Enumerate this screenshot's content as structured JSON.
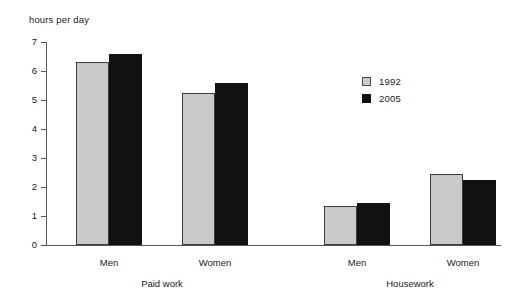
{
  "chart_data": {
    "type": "bar",
    "title": "",
    "subtitle": "",
    "ylabel": "hours per day",
    "xlabel": "",
    "ylim": [
      0,
      7
    ],
    "yticks": [
      "0",
      "1",
      "2",
      "3",
      "4",
      "5",
      "6",
      "7"
    ],
    "grid": false,
    "legend_position": "center-right",
    "categories": [
      "Men",
      "Women",
      "Men",
      "Women"
    ],
    "groups": [
      {
        "label": "Paid work",
        "categories": [
          "Men",
          "Women"
        ]
      },
      {
        "label": "Housework",
        "categories": [
          "Men",
          "Women"
        ]
      }
    ],
    "series": [
      {
        "name": "1992",
        "color": "#c9c9c9",
        "values": [
          6.3,
          5.25,
          1.35,
          2.45
        ]
      },
      {
        "name": "2005",
        "color": "#111111",
        "values": [
          6.6,
          5.6,
          1.45,
          2.25
        ]
      }
    ],
    "legend": [
      {
        "label": "1992",
        "color": "#c9c9c9"
      },
      {
        "label": "2005",
        "color": "#111111"
      }
    ]
  },
  "axis": {
    "y_title": "hours per day",
    "ticks": [
      {
        "value": 7,
        "label": "7"
      },
      {
        "value": 6,
        "label": "6"
      },
      {
        "value": 5,
        "label": "5"
      },
      {
        "value": 4,
        "label": "4"
      },
      {
        "value": 3,
        "label": "3"
      },
      {
        "value": 2,
        "label": "2"
      },
      {
        "value": 1,
        "label": "1"
      },
      {
        "value": 0,
        "label": "0"
      }
    ]
  },
  "bars": [
    {
      "name": "paid-work-men-1992",
      "series": "1992",
      "category": "Men",
      "group": "Paid work",
      "value": 6.3,
      "style": "light",
      "left": 30
    },
    {
      "name": "paid-work-men-2005",
      "series": "2005",
      "category": "Men",
      "group": "Paid work",
      "value": 6.6,
      "style": "dark",
      "left": 63
    },
    {
      "name": "paid-work-women-1992",
      "series": "1992",
      "category": "Women",
      "group": "Paid work",
      "value": 5.25,
      "style": "light",
      "left": 136
    },
    {
      "name": "paid-work-women-2005",
      "series": "2005",
      "category": "Women",
      "group": "Paid work",
      "value": 5.6,
      "style": "dark",
      "left": 169
    },
    {
      "name": "housework-men-1992",
      "series": "1992",
      "category": "Men",
      "group": "Housework",
      "value": 1.35,
      "style": "light",
      "left": 278
    },
    {
      "name": "housework-men-2005",
      "series": "2005",
      "category": "Men",
      "group": "Housework",
      "value": 1.45,
      "style": "dark",
      "left": 311
    },
    {
      "name": "housework-women-1992",
      "series": "1992",
      "category": "Women",
      "group": "Housework",
      "value": 2.45,
      "style": "light",
      "left": 384
    },
    {
      "name": "housework-women-2005",
      "series": "2005",
      "category": "Women",
      "group": "Housework",
      "value": 2.25,
      "style": "dark",
      "left": 417
    }
  ],
  "category_labels": [
    {
      "name": "category-label-paid-work-men",
      "text": "Men",
      "center": 63
    },
    {
      "name": "category-label-paid-work-women",
      "text": "Women",
      "center": 169
    },
    {
      "name": "category-label-housework-men",
      "text": "Men",
      "center": 311
    },
    {
      "name": "category-label-housework-women",
      "text": "Women",
      "center": 417
    }
  ],
  "group_labels": [
    {
      "name": "group-label-paid-work",
      "text": "Paid work",
      "center": 116
    },
    {
      "name": "group-label-housework",
      "text": "Housework",
      "center": 364
    }
  ]
}
